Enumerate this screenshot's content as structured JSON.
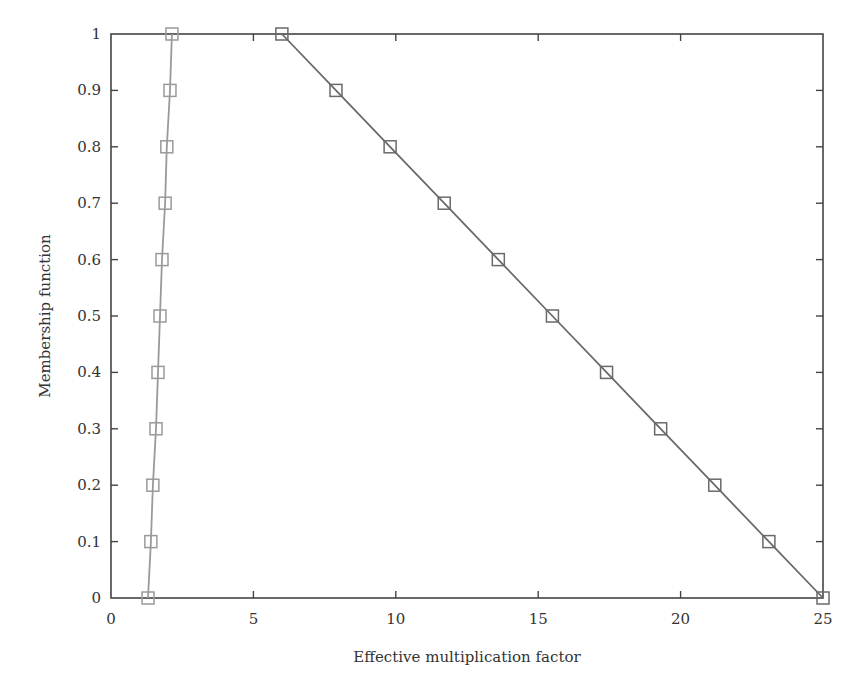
{
  "chart_data": {
    "type": "line",
    "title": "",
    "xlabel": "Effective multiplication factor",
    "ylabel": "Membership function",
    "xlim": [
      0,
      25
    ],
    "ylim": [
      0,
      1
    ],
    "xticks": [
      0,
      5,
      10,
      15,
      20,
      25
    ],
    "yticks": [
      0,
      0.1,
      0.2,
      0.3,
      0.4,
      0.5,
      0.6,
      0.7,
      0.8,
      0.9,
      1
    ],
    "xtick_labels": [
      "0",
      "5",
      "10",
      "15",
      "20",
      "25"
    ],
    "ytick_labels": [
      "0",
      "0.1",
      "0.2",
      "0.3",
      "0.4",
      "0.5",
      "0.6",
      "0.7",
      "0.8",
      "0.9",
      "1"
    ],
    "grid": false,
    "legend": null,
    "marker": "square",
    "series": [
      {
        "name": "left branch",
        "color": "#9a9a9a",
        "x": [
          1.3,
          1.4,
          1.47,
          1.58,
          1.65,
          1.72,
          1.79,
          1.9,
          1.96,
          2.07,
          2.14
        ],
        "y": [
          0,
          0.1,
          0.2,
          0.3,
          0.4,
          0.5,
          0.6,
          0.7,
          0.8,
          0.9,
          1
        ]
      },
      {
        "name": "right branch",
        "color": "#6a6a6a",
        "x": [
          6.0,
          7.9,
          9.8,
          11.7,
          13.6,
          15.5,
          17.4,
          19.3,
          21.2,
          23.1,
          25.0
        ],
        "y": [
          1,
          0.9,
          0.8,
          0.7,
          0.6,
          0.5,
          0.4,
          0.3,
          0.2,
          0.1,
          0
        ]
      }
    ]
  },
  "axes": {
    "x_title": "Effective multiplication factor",
    "y_title": "Membership function"
  },
  "colors": {
    "axis": "#444444",
    "text": "#333333",
    "left_series": "#9a9a9a",
    "right_series": "#6a6a6a"
  }
}
